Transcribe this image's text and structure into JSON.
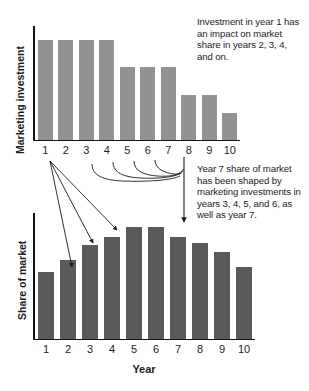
{
  "figure": {
    "background_color": "#ffffff"
  },
  "chart_data": [
    {
      "type": "bar",
      "id": "marketing-investment",
      "title": "",
      "xlabel": "",
      "ylabel": "Marketing investment",
      "categories": [
        "1",
        "2",
        "3",
        "4",
        "5",
        "6",
        "7",
        "8",
        "9",
        "10"
      ],
      "values": [
        100,
        100,
        100,
        100,
        73,
        73,
        73,
        45,
        45,
        27
      ],
      "ylim": [
        0,
        115
      ],
      "grid": false,
      "legend": null,
      "bar_color": "#939393",
      "axis_color": "#121212"
    },
    {
      "type": "bar",
      "id": "share-of-market",
      "title": "",
      "xlabel": "Year",
      "ylabel": "Share of market",
      "categories": [
        "1",
        "2",
        "3",
        "4",
        "5",
        "6",
        "7",
        "8",
        "9",
        "10"
      ],
      "values": [
        58,
        68,
        81,
        88,
        97,
        97,
        88,
        83,
        75,
        62
      ],
      "ylim": [
        0,
        110
      ],
      "grid": false,
      "legend": null,
      "bar_color": "#5a5a5a",
      "axis_color": "#121212"
    }
  ],
  "annotations": {
    "top_note": "Investment in year 1 has an impact on market share in years 2, 3, 4, and on.",
    "bottom_note": "Year 7 share of market has been shaped by marketing investments in years 3, 4, 5, and 6, as well as year 7.",
    "arrows_from_year1": [
      "2",
      "3",
      "4"
    ],
    "arrows_into_year7": [
      "3",
      "4",
      "5",
      "6"
    ]
  }
}
